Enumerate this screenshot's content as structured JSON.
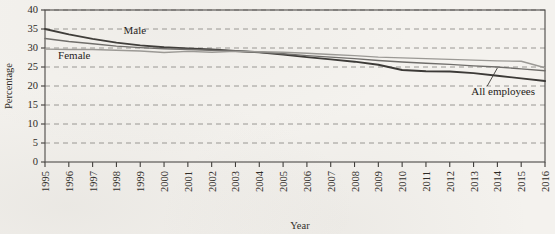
{
  "chart_data": {
    "type": "line",
    "title": "",
    "xlabel": "Year",
    "ylabel": "Percentage",
    "ylim": [
      0,
      40
    ],
    "ytick_step": 5,
    "yticks": [
      0,
      5,
      10,
      15,
      20,
      25,
      30,
      35,
      40
    ],
    "grid": true,
    "legend_position": "inline-annotations",
    "categories": [
      1995,
      1996,
      1997,
      1998,
      1999,
      2000,
      2001,
      2002,
      2003,
      2004,
      2005,
      2006,
      2007,
      2008,
      2009,
      2010,
      2011,
      2012,
      2013,
      2014,
      2015,
      2016
    ],
    "x_tick_labels": [
      "1995",
      "1996",
      "1997",
      "1998",
      "1999",
      "2000",
      "2001",
      "2002",
      "2003",
      "2004",
      "2005",
      "2006",
      "2007",
      "2008",
      "2009",
      "2010",
      "2011",
      "2012",
      "2013",
      "2014",
      "2015",
      "2016"
    ],
    "series": [
      {
        "name": "Male",
        "color": "#3c3a37",
        "width": 1.9,
        "values": [
          35.0,
          33.6,
          32.4,
          31.4,
          30.7,
          30.2,
          29.9,
          29.6,
          29.2,
          28.9,
          28.3,
          27.6,
          27.0,
          26.4,
          25.6,
          24.2,
          23.9,
          23.8,
          23.4,
          22.7,
          22.0,
          21.3
        ]
      },
      {
        "name": "All employees",
        "color": "#6f6d6a",
        "width": 1.4,
        "values": [
          32.5,
          31.7,
          31.1,
          30.5,
          30.1,
          29.8,
          29.6,
          29.4,
          29.2,
          28.9,
          28.5,
          28.0,
          27.6,
          27.2,
          26.7,
          26.3,
          26.0,
          25.7,
          25.3,
          25.0,
          24.5,
          24.0
        ]
      },
      {
        "name": "Female",
        "color": "#9b9995",
        "width": 1.4,
        "values": [
          29.7,
          29.6,
          29.6,
          29.4,
          29.2,
          28.8,
          29.1,
          28.9,
          29.1,
          29.0,
          28.9,
          28.6,
          28.3,
          28.0,
          27.6,
          27.4,
          27.2,
          27.0,
          26.8,
          26.6,
          26.5,
          24.8
        ]
      }
    ],
    "annotations": [
      {
        "text": "Male",
        "series": "Male"
      },
      {
        "text": "Female",
        "series": "Female"
      },
      {
        "text": "All employees",
        "series": "All employees",
        "leader_line": true
      }
    ]
  }
}
